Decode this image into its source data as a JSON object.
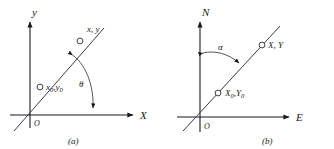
{
  "figure": {
    "name": "coordinate-systems-figure",
    "background_color": "#ffffff",
    "ink_color": "#1a1a1a",
    "panel_count": 2
  },
  "panel_a": {
    "caption": "(a)",
    "origin_label": "O",
    "axis_vertical_label": "y",
    "axis_horizontal_label": "X",
    "point_upper_label": "x, y",
    "point_lower_label_base": "x",
    "point_lower_label_sub": "0",
    "point_lower_label_base2": "y",
    "point_lower_label_sub2": "0",
    "point_lower_label": "x0, y0",
    "angle_label": "θ",
    "angle_name": "theta",
    "angle_description": "angle measured from X axis counterclockwise to line",
    "marker_count": 2
  },
  "panel_b": {
    "caption": "(b)",
    "origin_label": "O",
    "axis_vertical_label": "N",
    "axis_horizontal_label": "E",
    "point_upper_label": "X, Y",
    "point_lower_label_base": "X",
    "point_lower_label_sub": "0",
    "point_lower_label_base2": "Y",
    "point_lower_label_sub2": "0",
    "point_lower_label": "X0, Y0",
    "angle_label": "α",
    "angle_name": "alpha",
    "angle_description": "azimuth measured from N axis clockwise to line",
    "marker_count": 2
  }
}
